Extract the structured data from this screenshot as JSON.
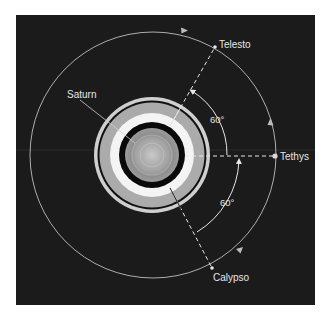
{
  "diagram": {
    "type": "orbital-diagram",
    "colors": {
      "background": "#1b1b1b",
      "page": "#ffffff",
      "orbit": "#bdbdbd",
      "ring_outer": "#cfcfcf",
      "ring_gap": "#111111",
      "ring_middle": "#a9a9a9",
      "ring_inner": "#f4f4f4",
      "ring_black": "#0a0a0a",
      "planet": "#9a9a9a",
      "planet_center": "#c4c4c4",
      "text": "#e6e6e6",
      "line": "#e6e6e6"
    },
    "labels": {
      "saturn": "Saturn",
      "telesto": "Telesto",
      "tethys": "Tethys",
      "calypso": "Calypso",
      "angle_upper": "60°",
      "angle_lower": "60°"
    },
    "bodies": [
      {
        "name": "Saturn",
        "role": "planet"
      },
      {
        "name": "Telesto",
        "role": "moon",
        "angle_from_tethys_deg": 60,
        "position": "leading"
      },
      {
        "name": "Tethys",
        "role": "moon",
        "angle_from_tethys_deg": 0
      },
      {
        "name": "Calypso",
        "role": "moon",
        "angle_from_tethys_deg": -60,
        "position": "trailing"
      }
    ],
    "angles": [
      {
        "from": "Tethys",
        "to": "Telesto",
        "value_deg": 60
      },
      {
        "from": "Calypso",
        "to": "Tethys",
        "value_deg": 60
      }
    ]
  }
}
